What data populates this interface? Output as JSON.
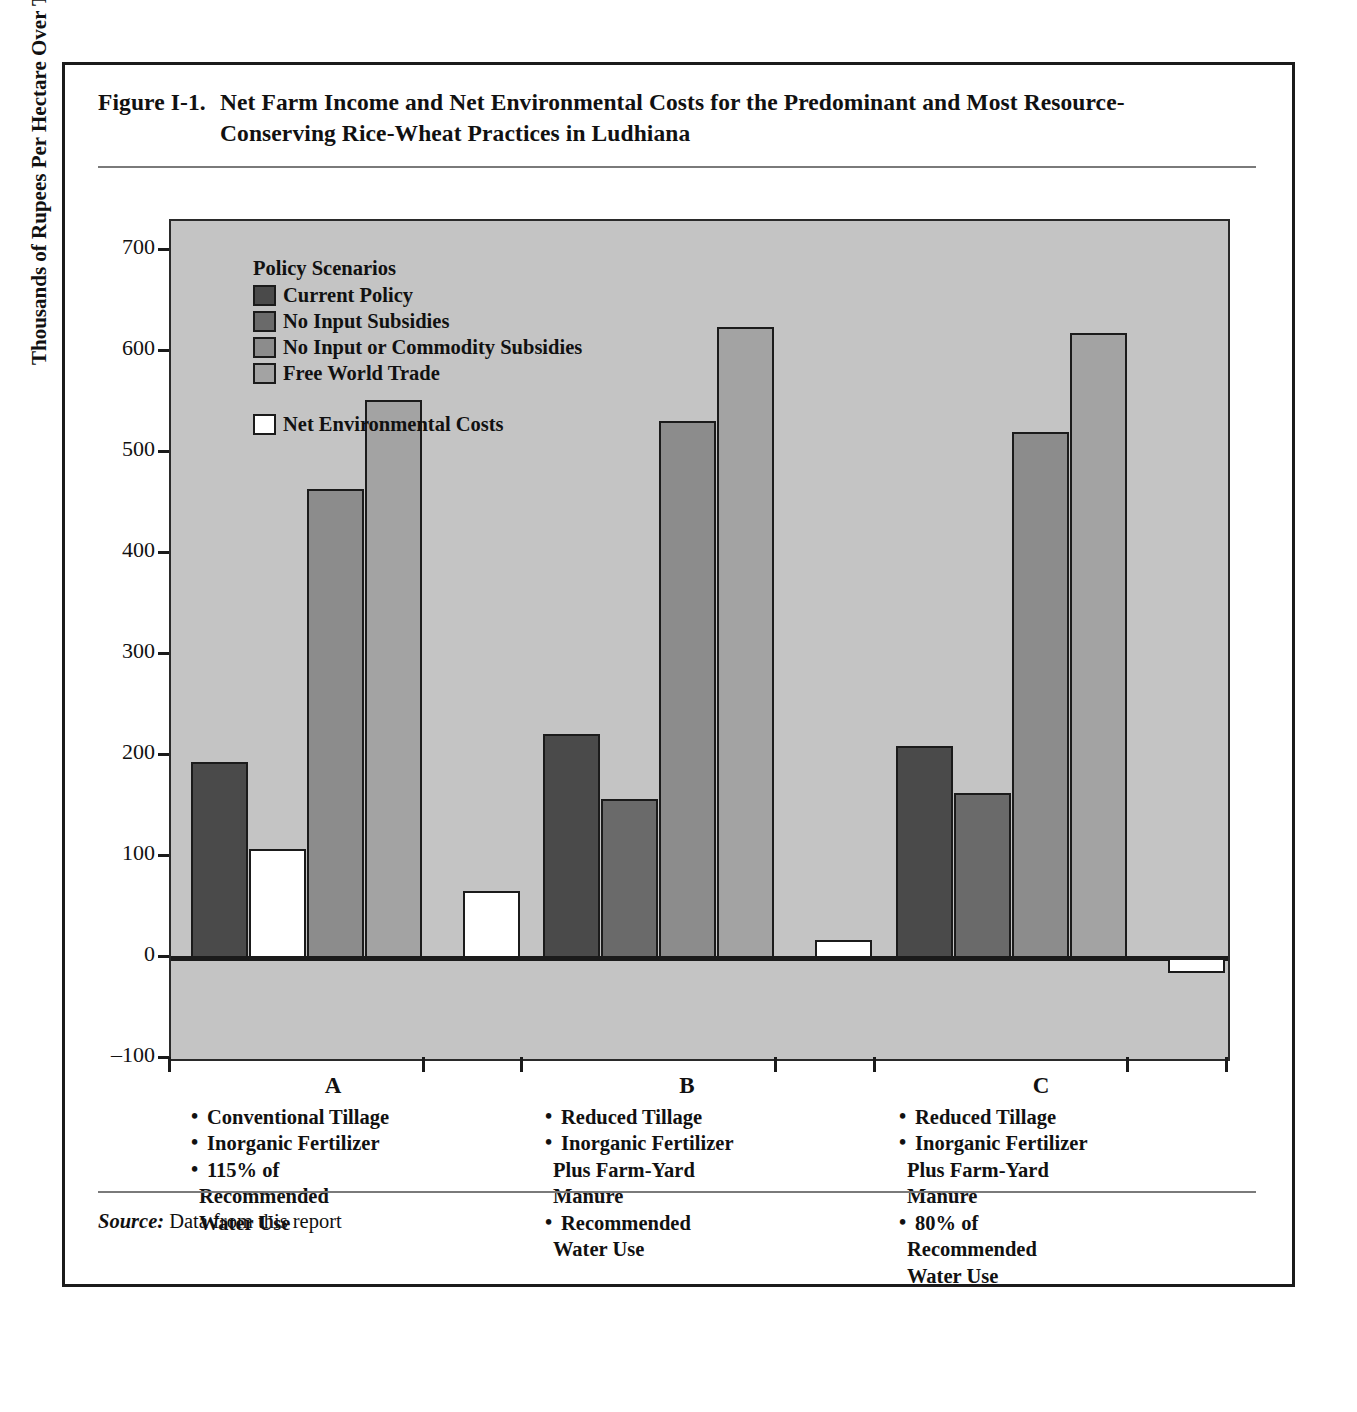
{
  "figure": {
    "number": "Figure I-1.",
    "title": "Net Farm Income and Net Environmental Costs for the Predominant and Most Resource-Conserving Rice-Wheat Practices in Ludhiana",
    "source_label": "Source:",
    "source_text": "Data from this report"
  },
  "legend": {
    "title": "Policy Scenarios",
    "items": [
      {
        "label": "Current Policy",
        "color": "#4a4a4a"
      },
      {
        "label": "No Input Subsidies",
        "color": "#6a6a6a"
      },
      {
        "label": "No Input or Commodity Subsidies",
        "color": "#8c8c8c"
      },
      {
        "label": "Free World Trade",
        "color": "#a3a3a3"
      }
    ],
    "extra": {
      "label": "Net Environmental Costs",
      "color": "#ffffff"
    }
  },
  "categories_detail": [
    {
      "letter": "A",
      "bullets": [
        "Conventional Tillage",
        "Inorganic Fertilizer",
        "115% of"
      ],
      "continuations": [
        "Recommended",
        "Water Use"
      ]
    },
    {
      "letter": "B",
      "bullets": [
        "Reduced Tillage",
        "Inorganic Fertilizer"
      ],
      "continuations_1": [
        "Plus Farm-Yard",
        "Manure"
      ],
      "bullets_2": [
        "Recommended"
      ],
      "continuations_2": [
        "Water Use"
      ]
    },
    {
      "letter": "C",
      "bullets": [
        "Reduced Tillage",
        "Inorganic Fertilizer"
      ],
      "continuations_1": [
        "Plus Farm-Yard",
        "Manure"
      ],
      "bullets_2": [
        "80% of"
      ],
      "continuations_2": [
        "Recommended",
        "Water Use"
      ]
    }
  ],
  "chart_data": {
    "type": "bar",
    "title": "Net Farm Income and Net Environmental Costs for the Predominant and Most Resource-Conserving Rice-Wheat Practices in Ludhiana",
    "xlabel": "",
    "ylabel": "Thousands of Rupees Per Hectare Over Thirty Years",
    "ylim": [
      -100,
      730
    ],
    "yticks": [
      -100,
      0,
      100,
      200,
      300,
      400,
      500,
      600,
      700
    ],
    "ytick_labels": [
      "–100",
      "0",
      "100",
      "200",
      "300",
      "400",
      "500",
      "600",
      "700"
    ],
    "grid": false,
    "legend_position": "upper-left-inside",
    "categories": [
      "A",
      "B",
      "C"
    ],
    "series": [
      {
        "name": "Current Policy",
        "color": "#4a4a4a",
        "values": [
          194,
          222,
          210
        ]
      },
      {
        "name": "No Input Subsidies",
        "color": "#6a6a6a",
        "values": [
          108,
          158,
          163
        ]
      },
      {
        "name": "No Input or Commodity Subsidies",
        "color": "#8c8c8c",
        "values": [
          465,
          532,
          521
        ]
      },
      {
        "name": "Free World Trade",
        "color": "#a3a3a3",
        "values": [
          553,
          625,
          619
        ]
      },
      {
        "name": "Net Environmental Costs",
        "color": "#ffffff",
        "values": [
          66,
          18,
          -15
        ]
      }
    ],
    "notes": [
      "Series 2 bar in group A is drawn with the white Net Environmental Costs fill in the original figure.",
      "Net Environmental Costs for practice C is negative (a net environmental benefit)."
    ]
  }
}
